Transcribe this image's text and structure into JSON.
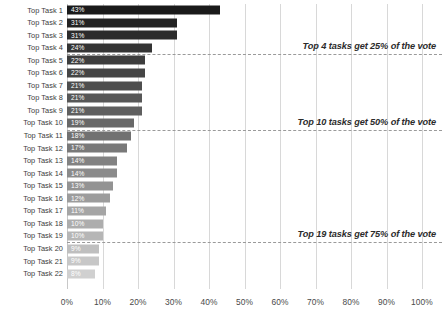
{
  "chart_data": {
    "type": "bar",
    "orientation": "horizontal",
    "title": "",
    "xlabel": "",
    "ylabel": "",
    "xlim": [
      0,
      100
    ],
    "grid": "vertical",
    "legend": "none",
    "categories": [
      "Top Task 1",
      "Top Task 2",
      "Top Task 3",
      "Top Task 4",
      "Top Task 5",
      "Top Task 6",
      "Top Task 7",
      "Top Task 8",
      "Top Task 9",
      "Top Task 10",
      "Top Task 11",
      "Top Task 12",
      "Top Task 13",
      "Top Task 14",
      "Top Task 15",
      "Top Task 16",
      "Top Task 17",
      "Top Task 18",
      "Top Task 19",
      "Top Task 20",
      "Top Task 21",
      "Top Task 22"
    ],
    "values": [
      43,
      31,
      31,
      24,
      22,
      22,
      21,
      21,
      21,
      19,
      18,
      17,
      14,
      14,
      13,
      12,
      11,
      10,
      10,
      9,
      9,
      8
    ],
    "data_labels": [
      "43%",
      "31%",
      "31%",
      "24%",
      "22%",
      "22%",
      "21%",
      "21%",
      "21%",
      "19%",
      "18%",
      "17%",
      "14%",
      "14%",
      "13%",
      "12%",
      "11%",
      "10%",
      "10%",
      "9%",
      "9%",
      "8%"
    ],
    "bar_colors": [
      "#1a1a1a",
      "#232323",
      "#2b2b2b",
      "#343434",
      "#3d3d3d",
      "#454545",
      "#4e4e4e",
      "#575757",
      "#5f5f5f",
      "#686868",
      "#717171",
      "#797979",
      "#828282",
      "#8b8b8b",
      "#939393",
      "#9c9c9c",
      "#a5a5a5",
      "#adadad",
      "#b6b6b6",
      "#bfbfbf",
      "#c7c7c7",
      "#d0d0d0"
    ],
    "xticks": [
      0,
      10,
      20,
      30,
      40,
      50,
      60,
      70,
      80,
      90,
      100
    ],
    "xtick_labels": [
      "0%",
      "10%",
      "20%",
      "30%",
      "40%",
      "50%",
      "60%",
      "70%",
      "80%",
      "90%",
      "100%"
    ],
    "annotations": [
      {
        "text": "Top 4 tasks get 25% of the vote",
        "after_row": 4
      },
      {
        "text": "Top 10 tasks get 50% of the vote",
        "after_row": 10
      },
      {
        "text": "Top 19 tasks get 75% of the vote",
        "after_row": 19
      }
    ],
    "colors": {
      "gridline": "#d8d8d8",
      "annotation_line": "#9a9a9a",
      "label_text": "#3c3c3c",
      "value_text": "#ffffff",
      "background": "#ffffff"
    }
  }
}
